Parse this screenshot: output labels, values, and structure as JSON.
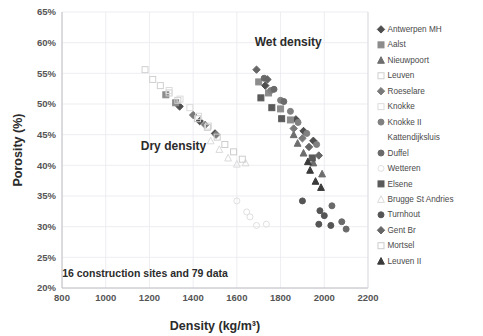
{
  "chart_data": {
    "type": "scatter",
    "title": "",
    "xlabel": "Density (kg/m³)",
    "ylabel": "Porosity (%)",
    "xlim": [
      800,
      2200
    ],
    "ylim": [
      20,
      65
    ],
    "xticks": [
      800,
      1000,
      1200,
      1400,
      1600,
      1800,
      2000,
      2200
    ],
    "yticks": [
      "20%",
      "25%",
      "30%",
      "35%",
      "40%",
      "45%",
      "50%",
      "55%",
      "60%",
      "65%"
    ],
    "grid": true,
    "legend_position": "right",
    "annotations": [
      {
        "text": "Dry density",
        "x": 1310,
        "y": 42.5
      },
      {
        "text": "Wet density",
        "x": 1835,
        "y": 59.5
      },
      {
        "text": "16 construction sites and 79 data",
        "x": 1180,
        "y": 21.8
      }
    ],
    "series": [
      {
        "name": "Antwerpen MH",
        "marker": "diamond",
        "color": "#4f4f4f",
        "fill": "solid",
        "points": [
          [
            1338,
            49.6
          ],
          [
            1430,
            47.2
          ],
          [
            1500,
            45.2
          ],
          [
            1870,
            47.5
          ],
          [
            1905,
            45.6
          ],
          [
            1950,
            44.0
          ],
          [
            1730,
            53.0
          ]
        ]
      },
      {
        "name": "Aalst",
        "marker": "square",
        "color": "#8c8c8c",
        "fill": "solid",
        "points": [
          [
            1275,
            51.5
          ],
          [
            1320,
            50.2
          ],
          [
            1800,
            49.2
          ],
          [
            1845,
            47.4
          ],
          [
            1700,
            53.6
          ],
          [
            1745,
            51.8
          ]
        ]
      },
      {
        "name": "Nieuwpoort",
        "marker": "triangle",
        "color": "#6e6e6e",
        "fill": "solid",
        "points": [
          [
            1905,
            42.0
          ],
          [
            1950,
            40.4
          ],
          [
            1990,
            38.6
          ],
          [
            1878,
            43.6
          ],
          [
            1860,
            45.0
          ]
        ]
      },
      {
        "name": "Leuven",
        "marker": "square",
        "color": "#d0d0d0",
        "fill": "open",
        "points": [
          [
            1180,
            55.6
          ],
          [
            1215,
            54.0
          ],
          [
            1250,
            53.0
          ],
          [
            1290,
            51.8
          ],
          [
            1330,
            50.6
          ]
        ]
      },
      {
        "name": "Roeselare",
        "marker": "diamond",
        "color": "#7a7a7a",
        "fill": "solid",
        "points": [
          [
            1400,
            48.2
          ],
          [
            1455,
            46.6
          ],
          [
            1505,
            45.0
          ],
          [
            1860,
            46.0
          ],
          [
            1900,
            44.4
          ]
        ]
      },
      {
        "name": "Knokke",
        "marker": "square",
        "color": "#dcdcdc",
        "fill": "open",
        "points": [
          [
            1290,
            52.2
          ],
          [
            1340,
            50.8
          ],
          [
            1385,
            49.4
          ],
          [
            1425,
            48.0
          ],
          [
            1470,
            46.4
          ]
        ]
      },
      {
        "name": "Knokke II",
        "marker": "circle",
        "color": "#808080",
        "fill": "solid",
        "points": [
          [
            1755,
            52.2
          ],
          [
            1800,
            50.6
          ],
          [
            1845,
            48.8
          ],
          [
            1880,
            47.0
          ],
          [
            1920,
            45.2
          ],
          [
            1965,
            43.4
          ]
        ]
      },
      {
        "name": "Kattendijksluis",
        "marker": "none",
        "color": "#ffffff",
        "fill": "none",
        "points": [
          [
            1600,
            44.0
          ]
        ]
      },
      {
        "name": "Duffel",
        "marker": "circle",
        "color": "#6a6a6a",
        "fill": "solid",
        "points": [
          [
            1725,
            54.2
          ],
          [
            1770,
            52.4
          ],
          [
            1815,
            50.4
          ],
          [
            2035,
            33.4
          ],
          [
            2080,
            30.8
          ],
          [
            2100,
            29.6
          ]
        ]
      },
      {
        "name": "Wetteren",
        "marker": "circle",
        "color": "#e0e0e0",
        "fill": "open",
        "points": [
          [
            1600,
            34.2
          ],
          [
            1645,
            32.4
          ],
          [
            1660,
            31.6
          ],
          [
            1690,
            30.2
          ],
          [
            1735,
            30.4
          ]
        ]
      },
      {
        "name": "Elsene",
        "marker": "square",
        "color": "#5a5a5a",
        "fill": "solid",
        "points": [
          [
            1710,
            51.0
          ],
          [
            1760,
            49.4
          ],
          [
            1805,
            47.6
          ],
          [
            1945,
            41.2
          ]
        ]
      },
      {
        "name": "Brugge St Andries",
        "marker": "triangle",
        "color": "#dadada",
        "fill": "open",
        "points": [
          [
            1520,
            42.6
          ],
          [
            1560,
            41.2
          ],
          [
            1600,
            40.2
          ],
          [
            1640,
            40.4
          ],
          [
            1480,
            44.0
          ]
        ]
      },
      {
        "name": "Turnhout",
        "marker": "circle",
        "color": "#555555",
        "fill": "solid",
        "points": [
          [
            1900,
            34.2
          ],
          [
            1980,
            32.6
          ],
          [
            2000,
            31.8
          ],
          [
            1975,
            30.4
          ],
          [
            2030,
            30.2
          ]
        ]
      },
      {
        "name": "Gent Br",
        "marker": "diamond",
        "color": "#666666",
        "fill": "solid",
        "points": [
          [
            1690,
            55.6
          ],
          [
            1740,
            54.0
          ],
          [
            1930,
            43.0
          ],
          [
            1975,
            41.6
          ]
        ]
      },
      {
        "name": "Mortsel",
        "marker": "square",
        "color": "#cccccc",
        "fill": "open",
        "points": [
          [
            1420,
            47.6
          ],
          [
            1465,
            46.2
          ],
          [
            1510,
            44.6
          ],
          [
            1545,
            43.4
          ],
          [
            1585,
            42.2
          ],
          [
            1625,
            41.0
          ]
        ]
      },
      {
        "name": "Leuven II",
        "marker": "triangle",
        "color": "#3a3a3a",
        "fill": "solid",
        "points": [
          [
            1935,
            39.2
          ],
          [
            1960,
            37.4
          ],
          [
            1985,
            36.4
          ],
          [
            1925,
            40.6
          ]
        ]
      }
    ]
  },
  "legend": {
    "items": [
      {
        "label": "Antwerpen MH"
      },
      {
        "label": "Aalst"
      },
      {
        "label": "Nieuwpoort"
      },
      {
        "label": "Leuven"
      },
      {
        "label": "Roeselare"
      },
      {
        "label": "Knokke"
      },
      {
        "label": "Knokke II"
      },
      {
        "label": "Kattendijksluis"
      },
      {
        "label": "Duffel"
      },
      {
        "label": "Wetteren"
      },
      {
        "label": "Elsene"
      },
      {
        "label": "Brugge St Andries"
      },
      {
        "label": "Turnhout"
      },
      {
        "label": "Gent Br"
      },
      {
        "label": "Mortsel"
      },
      {
        "label": "Leuven II"
      }
    ]
  }
}
